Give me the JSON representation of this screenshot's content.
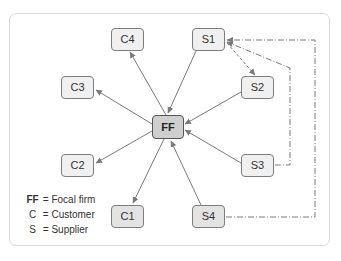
{
  "diagram": {
    "type": "supply-network",
    "focal": {
      "id": "FF",
      "label": "FF"
    },
    "nodes": [
      {
        "id": "C4",
        "label": "C4",
        "role": "customer"
      },
      {
        "id": "S1",
        "label": "S1",
        "role": "supplier"
      },
      {
        "id": "C3",
        "label": "C3",
        "role": "customer"
      },
      {
        "id": "S2",
        "label": "S2",
        "role": "supplier"
      },
      {
        "id": "FF",
        "label": "FF",
        "role": "focal"
      },
      {
        "id": "C2",
        "label": "C2",
        "role": "customer"
      },
      {
        "id": "S3",
        "label": "S3",
        "role": "supplier"
      },
      {
        "id": "C1",
        "label": "C1",
        "role": "customer"
      },
      {
        "id": "S4",
        "label": "S4",
        "role": "supplier"
      }
    ],
    "edges": [
      {
        "from": "FF",
        "to": "C4",
        "style": "solid"
      },
      {
        "from": "FF",
        "to": "C3",
        "style": "solid"
      },
      {
        "from": "FF",
        "to": "C2",
        "style": "solid"
      },
      {
        "from": "FF",
        "to": "C1",
        "style": "solid"
      },
      {
        "from": "S1",
        "to": "FF",
        "style": "solid"
      },
      {
        "from": "S2",
        "to": "FF",
        "style": "solid"
      },
      {
        "from": "S3",
        "to": "FF",
        "style": "solid"
      },
      {
        "from": "S4",
        "to": "FF",
        "style": "solid"
      },
      {
        "from": "S1",
        "to": "S2",
        "style": "dashed"
      },
      {
        "from": "S3",
        "to": "S1",
        "style": "dash-dot"
      },
      {
        "from": "S4",
        "to": "S1",
        "style": "dash-dot"
      }
    ],
    "legend": [
      {
        "key": "FF",
        "eq": "=",
        "text": "Focal firm"
      },
      {
        "key": "C",
        "eq": "=",
        "text": "Customer"
      },
      {
        "key": "S",
        "eq": "=",
        "text": "Supplier"
      }
    ],
    "colors": {
      "line": "#7a7a7a",
      "node_fill": "#f0f0f0",
      "focal_fill": "#cfcfcf",
      "frame": "#d9d9d9"
    }
  }
}
